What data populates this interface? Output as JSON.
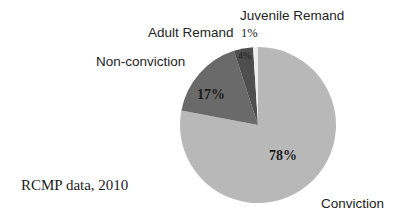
{
  "chart_data": {
    "type": "pie",
    "title": "",
    "source_note": "RCMP data, 2010",
    "legend_position": "outside-labels",
    "total": 100,
    "categories": [
      "Conviction",
      "Non-conviction",
      "Adult Remand",
      "Juvenile Remand"
    ],
    "values": [
      78,
      17,
      4,
      1
    ],
    "value_labels": [
      "78%",
      "17%",
      "4%",
      "1%"
    ],
    "colors": [
      "#b8b8b8",
      "#6a6a6a",
      "#4e4e4e",
      "#ededed"
    ],
    "start_angle_deg": 0,
    "direction": "clockwise",
    "slices": [
      {
        "name": "Conviction",
        "value": 78,
        "label": "Conviction",
        "value_label": "78%",
        "color": "#b8b8b8",
        "start_deg": 0,
        "end_deg": 280.8
      },
      {
        "name": "Non-conviction",
        "value": 17,
        "label": "Non-conviction",
        "value_label": "17%",
        "color": "#6a6a6a",
        "start_deg": 280.8,
        "end_deg": 342.0
      },
      {
        "name": "Adult Remand",
        "value": 4,
        "label": "Adult Remand",
        "value_label": "4%",
        "color": "#4e4e4e",
        "start_deg": 342.0,
        "end_deg": 356.4
      },
      {
        "name": "Juvenile Remand",
        "value": 1,
        "label": "Juvenile Remand",
        "value_label": "1%",
        "color": "#ededed",
        "start_deg": 356.4,
        "end_deg": 360.0
      }
    ]
  },
  "labels": {
    "juvenile_remand": "Juvenile Remand",
    "juvenile_remand_pct": "1%",
    "adult_remand": "Adult Remand",
    "adult_remand_pct": "4%",
    "non_conviction": "Non-conviction",
    "non_conviction_pct": "17%",
    "conviction": "Conviction",
    "conviction_pct": "78%"
  },
  "caption": {
    "source": "RCMP data, 2010"
  }
}
